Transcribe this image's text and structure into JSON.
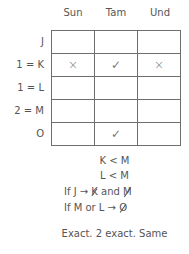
{
  "columns": [
    "Sun",
    "Tam",
    "Und"
  ],
  "rows": [
    {
      "label": "J",
      "cells": [
        "",
        "",
        ""
      ]
    },
    {
      "label": "1 = K",
      "cells": [
        "×",
        "✓",
        "×"
      ]
    },
    {
      "label": "1 = L",
      "cells": [
        "",
        "",
        ""
      ]
    },
    {
      "label": "2 = M",
      "cells": [
        "",
        "",
        ""
      ]
    },
    {
      "label": "O",
      "cells": [
        "",
        "✓",
        ""
      ]
    }
  ],
  "notes": {
    "line1": "K < M",
    "line2": "L < M",
    "line3": {
      "prefix": "If J →",
      "crossed1": "K",
      "mid": "and",
      "crossed2": "M"
    },
    "line4": {
      "prefix": "If M or L →",
      "crossed": "O"
    },
    "line5": "Exact. 2 exact. Same"
  }
}
